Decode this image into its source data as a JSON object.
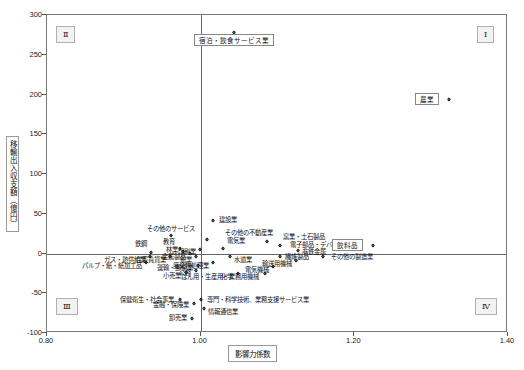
{
  "chart_data": {
    "type": "scatter",
    "title": "",
    "xlabel": "影響力係数",
    "ylabel": "移輸出入収支額（億円）",
    "xlim": [
      0.8,
      1.4
    ],
    "ylim": [
      -100,
      300
    ],
    "xticks": [
      "0.80",
      "1.00",
      "1.20",
      "1.40"
    ],
    "yticks": [
      "300",
      "250",
      "200",
      "150",
      "100",
      "50",
      "0",
      "-50",
      "-100"
    ],
    "grid": false,
    "legend": "none",
    "reference_lines": {
      "vertical_x": 1.0,
      "horizontal_y": 0
    },
    "quadrants": [
      {
        "name": "I",
        "label": "Ⅰ",
        "position": "top-right"
      },
      {
        "name": "II",
        "label": "Ⅱ",
        "position": "top-left"
      },
      {
        "name": "III",
        "label": "Ⅲ",
        "position": "bottom-left"
      },
      {
        "name": "IV",
        "label": "Ⅳ",
        "position": "bottom-right"
      }
    ],
    "points": [
      {
        "label": "宿泊・飲食サービス業",
        "x": 1.045,
        "y": 277,
        "boxed": true
      },
      {
        "label": "農業",
        "x": 1.325,
        "y": 193,
        "boxed": true
      },
      {
        "label": "建設業",
        "x": 1.018,
        "y": 41,
        "boxed": false
      },
      {
        "label": "その他のサービス",
        "x": 0.963,
        "y": 22,
        "boxed": false
      },
      {
        "label": "その他の不動産業",
        "x": 1.01,
        "y": 17,
        "boxed": false
      },
      {
        "label": "窯業・土石製品",
        "x": 1.088,
        "y": 14,
        "boxed": false
      },
      {
        "label": "電子部品・デバイス",
        "x": 1.105,
        "y": 9,
        "boxed": false
      },
      {
        "label": "飲料品",
        "x": 1.225,
        "y": 9,
        "boxed": true
      },
      {
        "label": "非鉄金属",
        "x": 1.128,
        "y": 3,
        "boxed": false
      },
      {
        "label": "教育",
        "x": 0.975,
        "y": 6,
        "boxed": false
      },
      {
        "label": "印刷業",
        "x": 1.0,
        "y": 4,
        "boxed": false
      },
      {
        "label": "電気業",
        "x": 1.03,
        "y": 6,
        "boxed": false
      },
      {
        "label": "鉄鋼",
        "x": 0.937,
        "y": 1,
        "boxed": false
      },
      {
        "label": "林業",
        "x": 0.978,
        "y": 2,
        "boxed": false
      },
      {
        "label": "金属製品",
        "x": 0.988,
        "y": -1,
        "boxed": false
      },
      {
        "label": "ガス・熱供給業",
        "x": 0.935,
        "y": -5,
        "boxed": false
      },
      {
        "label": "住宅賃貸業",
        "x": 0.962,
        "y": -5,
        "boxed": false
      },
      {
        "label": "鉱業",
        "x": 0.995,
        "y": -5,
        "boxed": false
      },
      {
        "label": "水道業",
        "x": 1.04,
        "y": -5,
        "boxed": false
      },
      {
        "label": "繊維製品",
        "x": 1.105,
        "y": -4,
        "boxed": false
      },
      {
        "label": "その他の製造業",
        "x": 1.16,
        "y": -4,
        "boxed": false
      },
      {
        "label": "輸送用機械",
        "x": 1.125,
        "y": -10,
        "boxed": false
      },
      {
        "label": "パルプ・紙・紙加工品",
        "x": 0.93,
        "y": -12,
        "boxed": false
      },
      {
        "label": "廃棄物処理業",
        "x": 1.018,
        "y": -12,
        "boxed": false
      },
      {
        "label": "運輸・郵便業",
        "x": 0.998,
        "y": -16,
        "boxed": false
      },
      {
        "label": "電気機械",
        "x": 1.095,
        "y": -17,
        "boxed": false
      },
      {
        "label": "公務",
        "x": 0.995,
        "y": -22,
        "boxed": false
      },
      {
        "label": "小売業",
        "x": 0.982,
        "y": -25,
        "boxed": false
      },
      {
        "label": "化学",
        "x": 1.05,
        "y": -26,
        "boxed": false
      },
      {
        "label": "はん用・生産用・業務用機械",
        "x": 1.085,
        "y": -26,
        "boxed": false
      },
      {
        "label": "保健衛生・社会事業",
        "x": 0.975,
        "y": -59,
        "boxed": false
      },
      {
        "label": "金融・保険業",
        "x": 0.992,
        "y": -63,
        "boxed": false
      },
      {
        "label": "専門・科学技術、業務支援サービス業",
        "x": 1.002,
        "y": -59,
        "boxed": false
      },
      {
        "label": "情報通信業",
        "x": 1.005,
        "y": -70,
        "boxed": false
      },
      {
        "label": "卸売業",
        "x": 0.99,
        "y": -82,
        "boxed": false
      }
    ]
  }
}
